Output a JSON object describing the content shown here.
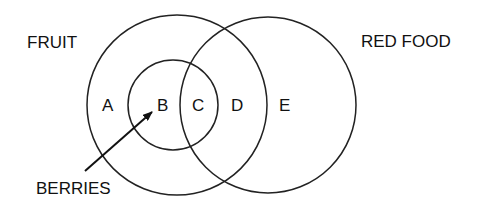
{
  "diagram": {
    "type": "venn",
    "sets": [
      {
        "id": "fruit",
        "label": "FRUIT"
      },
      {
        "id": "red_food",
        "label": "RED FOOD"
      },
      {
        "id": "berries",
        "label": "BERRIES",
        "subset_of": "fruit"
      }
    ],
    "regions": [
      {
        "label": "A",
        "description": "fruit only"
      },
      {
        "label": "B",
        "description": "berries not red"
      },
      {
        "label": "C",
        "description": "red berries"
      },
      {
        "label": "D",
        "description": "red fruit, not berries"
      },
      {
        "label": "E",
        "description": "red food, not fruit"
      }
    ],
    "colors": {
      "stroke": "#222222",
      "text": "#111111",
      "background": "#ffffff"
    }
  }
}
